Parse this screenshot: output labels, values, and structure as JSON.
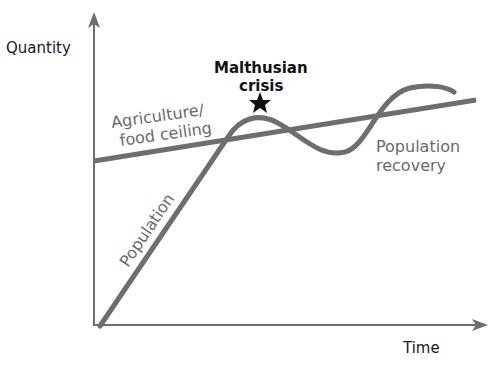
{
  "diagram": {
    "axes": {
      "y_label": "Quantity",
      "x_label": "Time"
    },
    "labels": {
      "ceiling_line1": "Agriculture/",
      "ceiling_line2": "food ceiling",
      "population": "Population",
      "crisis_line1": "Malthusian",
      "crisis_line2": "crisis",
      "recovery_line1": "Population",
      "recovery_line2": "recovery"
    },
    "markers": {
      "crisis_marker": "star-icon"
    },
    "colors": {
      "axis": "#6e6e6e",
      "curve": "#6e6e6e",
      "text": "#1a1a1a",
      "gray_text": "#6b6b6b",
      "star": "#111111"
    }
  }
}
